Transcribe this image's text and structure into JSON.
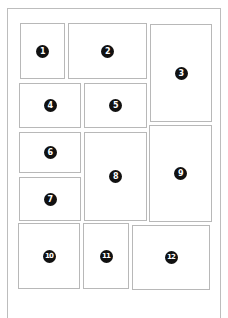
{
  "diagram": {
    "type": "page-layout-grid",
    "panels": [
      {
        "id": "1",
        "label": "1",
        "x": 20,
        "y": 23,
        "w": 45,
        "h": 56
      },
      {
        "id": "2",
        "label": "2",
        "x": 68,
        "y": 23,
        "w": 79,
        "h": 56
      },
      {
        "id": "3",
        "label": "3",
        "x": 150,
        "y": 24,
        "w": 62,
        "h": 98
      },
      {
        "id": "4",
        "label": "4",
        "x": 19,
        "y": 83,
        "w": 62,
        "h": 45
      },
      {
        "id": "5",
        "label": "5",
        "x": 84,
        "y": 83,
        "w": 63,
        "h": 45
      },
      {
        "id": "6",
        "label": "6",
        "x": 19,
        "y": 132,
        "w": 62,
        "h": 41
      },
      {
        "id": "7",
        "label": "7",
        "x": 19,
        "y": 177,
        "w": 62,
        "h": 44
      },
      {
        "id": "8",
        "label": "8",
        "x": 84,
        "y": 132,
        "w": 63,
        "h": 89
      },
      {
        "id": "9",
        "label": "9",
        "x": 149,
        "y": 125,
        "w": 63,
        "h": 97
      },
      {
        "id": "10",
        "label": "10",
        "x": 18,
        "y": 223,
        "w": 62,
        "h": 66
      },
      {
        "id": "11",
        "label": "11",
        "x": 83,
        "y": 223,
        "w": 46,
        "h": 66
      },
      {
        "id": "12",
        "label": "12",
        "x": 132,
        "y": 225,
        "w": 78,
        "h": 65
      }
    ]
  },
  "colors": {
    "frame_border": "#bdbdbd",
    "panel_border": "#b8b8b8",
    "badge_fill": "#111111",
    "badge_text": "#ffffff",
    "background": "#ffffff"
  }
}
